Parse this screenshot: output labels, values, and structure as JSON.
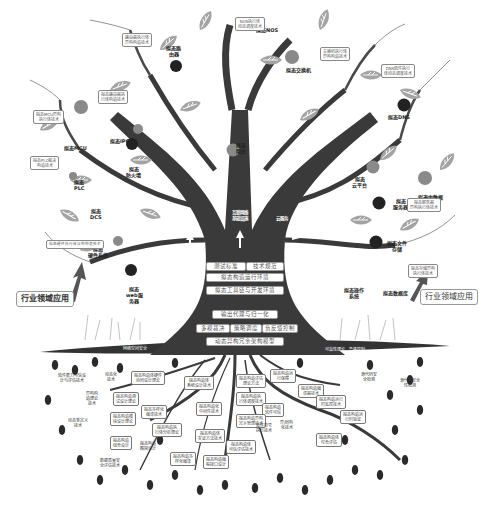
{
  "diagram": {
    "colors": {
      "trunk": "#3a3a3a",
      "leaf": "#9a9a9a",
      "apple_dark": "#222222",
      "apple_light": "#8a8a8a",
      "seed": "#2a2a2a",
      "box_border": "#888888"
    },
    "products": [
      {
        "id": "nos",
        "label": "拟态NOS",
        "apple": "none"
      },
      {
        "id": "router",
        "label": "拟态路\n由器",
        "apple": "dark"
      },
      {
        "id": "switch",
        "label": "拟态交换机",
        "apple": "light"
      },
      {
        "id": "dns",
        "label": "拟态DNS",
        "apple": "dark"
      },
      {
        "id": "mcu",
        "label": "拟态MCU",
        "apple": "light"
      },
      {
        "id": "ipc",
        "label": "拟态IPC",
        "apple": "light"
      },
      {
        "id": "plc",
        "label": "拟态\nPLC",
        "apple": "light"
      },
      {
        "id": "dcs",
        "label": "拟态\nDCS",
        "apple": "light"
      },
      {
        "id": "firewall",
        "label": "拟态\n防火墙",
        "apple": "dark"
      },
      {
        "id": "gateway",
        "label": "拟态\n网关",
        "apple": "light"
      },
      {
        "id": "cloud",
        "label": "拟态\n云平台",
        "apple": "light"
      },
      {
        "id": "bigdata",
        "label": "拟态大数据\n一体机",
        "apple": "light"
      },
      {
        "id": "server",
        "label": "拟态\n服务器",
        "apple": "dark"
      },
      {
        "id": "storage",
        "label": "拟态文件\n存储",
        "apple": "dark"
      },
      {
        "id": "hw",
        "label": "拟态\n硬件系统",
        "apple": "light"
      },
      {
        "id": "web",
        "label": "拟态\nweb服\n务器",
        "apple": "dark"
      },
      {
        "id": "os",
        "label": "拟态操作\n系统",
        "apple": "none"
      },
      {
        "id": "db",
        "label": "拟态数据库",
        "apple": "none"
      }
    ],
    "branch_boxes": [
      "NOS执行体\n动态调度技术",
      "路由器执行体\n异构构造技术",
      "交换机执行体\n异构构造技术",
      "DNS软件执行\n体动态调度技术",
      "拟态路由器执\n行体构造技术",
      "拟态MCU异构\n执行体技术",
      "拟态PLC裁决\n构造技术",
      "拟态硬件执行体异构构造技术",
      "拟态服务器\n异构执行体技术",
      "拟态存储异构\n执行体技术"
    ],
    "trunk": {
      "arrows_top": [
        "互联网络\n基础设施",
        "工业\n控制",
        "云服务"
      ],
      "row1": [
        "测试标准",
        "技术规范"
      ],
      "row2": "拟态构造运行环境",
      "row3": "拟态工具链与开发环境",
      "row4": "输出代理与归一化",
      "row5": [
        "多模裁决",
        "策略调度",
        "负反馈控制"
      ],
      "row6": "动态异构冗余架构模型",
      "arrow_right": "管理"
    },
    "ground": {
      "left": "网络空间安全",
      "right": "可靠性理论、鲁棒控制"
    },
    "industry": {
      "left": "行业领域应用",
      "right": "行业领域应用"
    },
    "roots": [
      {
        "text": "软件能力可信设\n计与评估技术",
        "boxed": false
      },
      {
        "text": "动态化\n技术",
        "boxed": false
      },
      {
        "text": "拟态构造体硬件\n协同设计理论",
        "boxed": true
      },
      {
        "text": "拟态构造体\n系统设计技术",
        "boxed": true
      },
      {
        "text": "异构构\n造理论\n技术",
        "boxed": false
      },
      {
        "text": "拟态构造测\n试设计理论",
        "boxed": true
      },
      {
        "text": "拟态构造化\n中间件技术",
        "boxed": true
      },
      {
        "text": "动态重定义\n技术",
        "boxed": false
      },
      {
        "text": "拟态构造模\n块设计理论",
        "boxed": true
      },
      {
        "text": "拟态多样化\n编译技术",
        "boxed": true
      },
      {
        "text": "拟态构造执\n行体分析理论",
        "boxed": true
      },
      {
        "text": "拟态构造\n组合设计",
        "boxed": true
      },
      {
        "text": "拟态构造体\n实证方法技术",
        "boxed": true
      },
      {
        "text": "拟态构造\n精简设计",
        "boxed": true
      },
      {
        "text": "数据质量安\n全评估技术",
        "boxed": false
      },
      {
        "text": "拟态构造评估\n理论方法",
        "boxed": true
      },
      {
        "text": "拟态构造运\n行保障",
        "boxed": true
      },
      {
        "text": "拟态构造执\n行体调度技术",
        "boxed": true
      },
      {
        "text": "拟态构造\n软件可信",
        "boxed": true
      },
      {
        "text": "拟态构造异构\n冗余管理技术",
        "boxed": true
      },
      {
        "text": "拟态构造编\n译器技术",
        "boxed": true
      },
      {
        "text": "异/同构\n化技术",
        "boxed": false
      },
      {
        "text": "拟态构造体\n综合评估",
        "boxed": true
      },
      {
        "text": "软件符号\n执行技术",
        "boxed": false
      },
      {
        "text": "源代码安\n全检测",
        "boxed": false
      },
      {
        "text": "拟态构造运行\n时监控技术",
        "boxed": true
      },
      {
        "text": "拟态构造体\n可信评估技术",
        "boxed": true
      },
      {
        "text": "拟态构造编\n程接口设计",
        "boxed": true
      },
      {
        "text": "源代码安全\n性检测",
        "boxed": false
      },
      {
        "text": "拟态构造多\n样化编译",
        "boxed": true
      },
      {
        "text": "拟态构造运\n行时验证",
        "boxed": true
      }
    ]
  }
}
